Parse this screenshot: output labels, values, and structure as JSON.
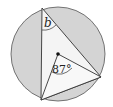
{
  "diagram": {
    "type": "circle-geometry",
    "labels": {
      "inscribed_angle": "b",
      "central_angle": "87°"
    },
    "colors": {
      "circle_fill": "#d4d4d4",
      "triangle_fill": "#f4f4f4",
      "stroke": "#333333",
      "center_dot": "#111111"
    }
  }
}
